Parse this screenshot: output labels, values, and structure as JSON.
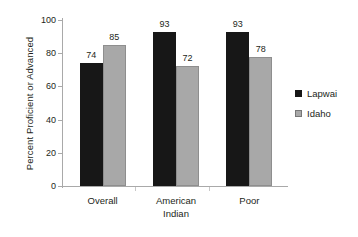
{
  "chart_data": {
    "type": "bar",
    "title": "",
    "xlabel": "",
    "ylabel": "Percent Proficient or Advanced",
    "categories": [
      "Overall",
      "American\nIndian",
      "Poor"
    ],
    "series": [
      {
        "name": "Lapwai",
        "color": "#171717",
        "values": [
          74,
          93,
          93
        ]
      },
      {
        "name": "Idaho",
        "color": "#a8a8a8",
        "values": [
          85,
          72,
          78
        ]
      }
    ],
    "ylim": [
      0,
      100
    ],
    "yticks": [
      0,
      20,
      40,
      60,
      80,
      100
    ],
    "ytick_labels": [
      "0",
      "20",
      "40",
      "60",
      "80",
      "100"
    ],
    "grid": false,
    "legend_position": "right",
    "data_labels": true
  }
}
